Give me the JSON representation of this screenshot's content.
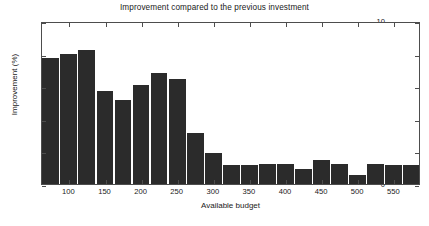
{
  "chart_data": {
    "type": "bar",
    "title": "Improvement compared to the previous investment",
    "xlabel": "Available budget",
    "ylabel": "Improvement (%)",
    "categories": [
      75,
      100,
      125,
      150,
      175,
      200,
      225,
      250,
      275,
      300,
      325,
      350,
      375,
      400,
      425,
      450,
      475,
      500,
      525,
      550,
      575
    ],
    "values": [
      7.75,
      8.0,
      8.2,
      5.7,
      5.15,
      6.05,
      6.8,
      6.45,
      3.1,
      1.9,
      1.15,
      1.15,
      1.2,
      1.2,
      0.9,
      1.5,
      1.2,
      0.55,
      1.2,
      1.15,
      1.15
    ],
    "ylim": [
      0,
      10
    ],
    "xlim": [
      62,
      587
    ],
    "yticks": [
      0,
      2,
      4,
      6,
      8,
      10
    ],
    "xticks": [
      100,
      150,
      200,
      250,
      300,
      350,
      400,
      450,
      500,
      550
    ],
    "grid": false,
    "legend": null,
    "bar_color": "#2b2b2b",
    "axis_color": "#4d4d4d",
    "background_color": "#ffffff",
    "bar_width": 25
  }
}
